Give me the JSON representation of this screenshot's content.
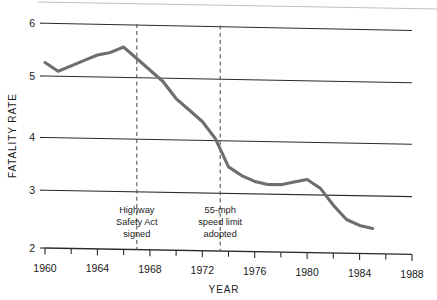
{
  "chart_data": {
    "type": "line",
    "title": "",
    "xlabel": "YEAR",
    "ylabel": "FATALITY RATE",
    "xlim": [
      1960,
      1988
    ],
    "ylim": [
      2,
      6
    ],
    "grid": "horizontal-gridlines-at-y-ticks",
    "legend": "none",
    "x_ticks_major": [
      1960,
      1964,
      1968,
      1972,
      1976,
      1980,
      1984,
      1988
    ],
    "x_ticks_minor": [
      1962,
      1966,
      1970,
      1974,
      1978,
      1982,
      1986
    ],
    "y_ticks": [
      2,
      3,
      4,
      5,
      6
    ],
    "x": [
      1960,
      1961,
      1962,
      1963,
      1964,
      1965,
      1966,
      1967,
      1968,
      1969,
      1970,
      1971,
      1972,
      1973,
      1974,
      1975,
      1976,
      1977,
      1978,
      1979,
      1980,
      1981,
      1982,
      1983,
      1984,
      1985
    ],
    "values": [
      5.3,
      5.15,
      5.25,
      5.35,
      5.45,
      5.5,
      5.6,
      5.4,
      5.2,
      5.0,
      4.7,
      4.5,
      4.3,
      4.0,
      3.5,
      3.35,
      3.25,
      3.2,
      3.2,
      3.25,
      3.3,
      3.15,
      2.85,
      2.6,
      2.5,
      2.45
    ],
    "series_label": "Motor vehicle fatality rate",
    "annotations": [
      {
        "name": "highway-safety-act",
        "x": 1967,
        "lines": [
          "Highway",
          "Safety Act",
          "signed"
        ],
        "style": "vertical-dashed-line"
      },
      {
        "name": "speed-limit-adopted",
        "x": 1973.5,
        "lines": [
          "55-mph",
          "speed limit",
          "adopted"
        ],
        "style": "vertical-dashed-line"
      }
    ],
    "colors": {
      "line": "#6e6e6e",
      "axis": "#2b2b2b",
      "annotation_dash": "#555555",
      "background": "#ffffff",
      "text": "#1a1a1a"
    }
  },
  "axes": {
    "y_tick_labels": [
      "6",
      "5",
      "4",
      "3",
      "2"
    ],
    "x_tick_labels": [
      "1960",
      "1964",
      "1968",
      "1972",
      "1976",
      "1980",
      "1984",
      "1988"
    ],
    "y_axis_title": "FATALITY RATE",
    "x_axis_title": "YEAR"
  },
  "annotations": {
    "first": {
      "line1": "Highway",
      "line2": "Safety Act",
      "line3": "signed"
    },
    "second": {
      "line1": "55-mph",
      "line2": "speed limit",
      "line3": "adopted"
    }
  }
}
